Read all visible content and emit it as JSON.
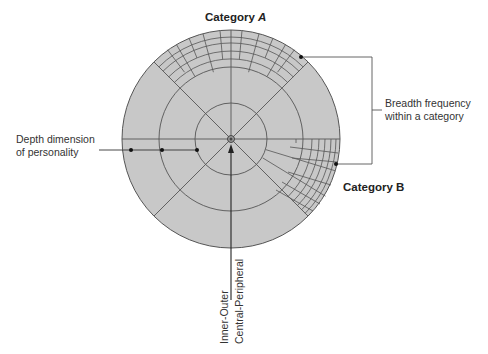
{
  "diagram": {
    "labels": {
      "category_a": "Category",
      "category_a_letter": "A",
      "category_b": "Category B",
      "breadth_line1": "Breadth frequency",
      "breadth_line2": "within a category",
      "depth_line1": "Depth dimension",
      "depth_line2": "of personality",
      "inner_outer": "Inner-Outer",
      "central_peripheral": "Central-Peripheral"
    },
    "colors": {
      "disc_fill": "#c8c8c8",
      "line": "#555555",
      "text": "#333333"
    },
    "geometry": {
      "center": [
        231,
        139
      ],
      "radius": 109,
      "rings": [
        36,
        72,
        109
      ]
    }
  }
}
